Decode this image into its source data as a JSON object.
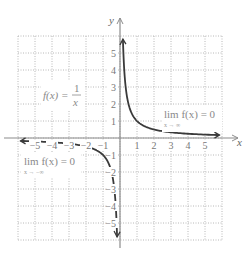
{
  "chart_data": {
    "type": "line",
    "title": "",
    "function_label": "f(x) = 1/x",
    "xlabel": "x",
    "ylabel": "y",
    "xlim": [
      -6,
      6
    ],
    "ylim": [
      -6,
      6
    ],
    "grid": true,
    "grid_style": "dotted",
    "x_ticks": [
      -5,
      -4,
      -3,
      -2,
      -1,
      1,
      2,
      3,
      4,
      5
    ],
    "y_ticks": [
      -5,
      -4,
      -3,
      -2,
      -1,
      1,
      2,
      3,
      4,
      5
    ],
    "x_tick_labels": [
      "−5",
      "−4",
      "−3",
      "−2",
      "−1",
      "1",
      "2",
      "3",
      "4",
      "5"
    ],
    "y_tick_labels": [
      "−5",
      "−4",
      "−3",
      "−2",
      "−1",
      "1",
      "2",
      "3",
      "4",
      "5"
    ],
    "series": [
      {
        "name": "f(x) = 1/x (x > 0)",
        "x": [
          0.17,
          0.2,
          0.25,
          0.33,
          0.5,
          1,
          2,
          3,
          4,
          5,
          5.8
        ],
        "y": [
          5.8,
          5,
          4,
          3,
          2,
          1,
          0.5,
          0.33,
          0.25,
          0.2,
          0.17
        ]
      },
      {
        "name": "f(x) = 1/x (x < 0)",
        "x": [
          -5.8,
          -5,
          -4,
          -3,
          -2,
          -1,
          -0.5,
          -0.33,
          -0.25,
          -0.2,
          -0.17
        ],
        "y": [
          -0.17,
          -0.2,
          -0.25,
          -0.33,
          -0.5,
          -1,
          -2,
          -3,
          -4,
          -5,
          -5.8
        ]
      }
    ],
    "annotations": [
      {
        "text": "lim f(x) = 0",
        "sub": "x → ∞",
        "position": "right, above x-axis"
      },
      {
        "text": "lim f(x) = 0",
        "sub": "x → −∞",
        "position": "left, below x-axis"
      },
      {
        "text": "f(x) = 1/x",
        "position": "upper-left quadrant"
      }
    ]
  },
  "labels": {
    "x_axis": "x",
    "y_axis": "y",
    "func_left": "f(x) = ",
    "func_num": "1",
    "func_den": "x",
    "lim_pos_main": "lim f(x) = 0",
    "lim_pos_sub": "x → ∞",
    "lim_neg_main": "lim f(x) = 0",
    "lim_neg_sub": "x → −∞"
  },
  "colors": {
    "grid": "#b8b8b8",
    "axis": "#8c8c8c",
    "curve": "#3a3a3a",
    "text": "#8a8a8a"
  }
}
